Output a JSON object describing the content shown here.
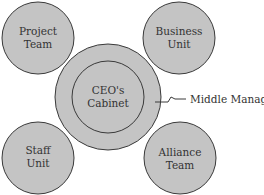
{
  "diagram": {
    "colors": {
      "fill": "#c4c4c4",
      "stroke": "#3a3a3a",
      "text": "#333333",
      "background": "#ffffff"
    },
    "outer_ring_label": "Middle Managers",
    "center": {
      "line1": "CEO's",
      "line2": "Cabinet"
    },
    "satellites": [
      {
        "position": "top-left",
        "line1": "Project",
        "line2": "Team"
      },
      {
        "position": "top-right",
        "line1": "Business",
        "line2": "Unit"
      },
      {
        "position": "bottom-left",
        "line1": "Staff",
        "line2": "Unit"
      },
      {
        "position": "bottom-right",
        "line1": "Alliance",
        "line2": "Team"
      }
    ]
  }
}
